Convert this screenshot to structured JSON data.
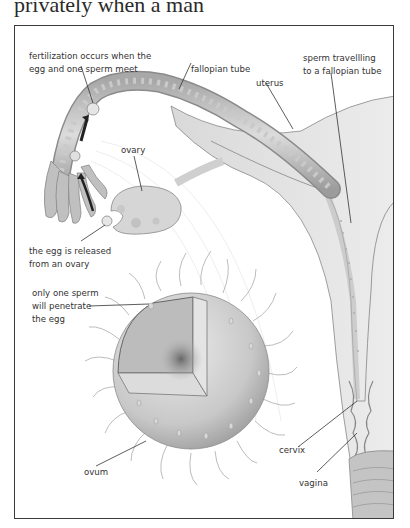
{
  "page": {
    "top_text": "privately when a man"
  },
  "diagram": {
    "labels": {
      "fertilization_line1": "fertilization occurs when the",
      "fertilization_line2": "egg and one sperm meet",
      "fallopian_tube": "fallopian tube",
      "uterus": "uterus",
      "sperm_travelling_line1": "sperm travellling",
      "sperm_travelling_line2": "to a fallopian tube",
      "ovary": "ovary",
      "egg_released_line1": "the egg is released",
      "egg_released_line2": "from an ovary",
      "one_sperm_line1": "only one sperm",
      "one_sperm_line2": "will penetrate",
      "one_sperm_line3": "the egg",
      "ovum": "ovum",
      "cervix": "cervix",
      "vagina": "vagina"
    },
    "colors": {
      "frame_border": "#3a3a3a",
      "tissue_light": "#e6e6e6",
      "tissue_mid": "#cfcfcf",
      "tissue_dark": "#9a9a9a",
      "arrow": "#222222",
      "leader_line": "#333333"
    }
  }
}
